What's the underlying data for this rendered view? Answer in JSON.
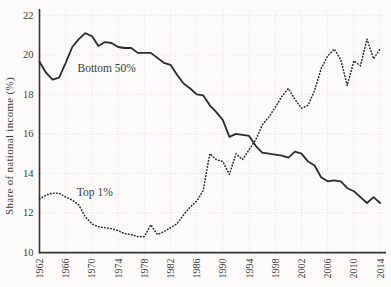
{
  "figure": {
    "width_px": 391,
    "height_px": 287
  },
  "chart_data": {
    "type": "line",
    "title": "",
    "xlabel": "",
    "ylabel": "Share of national income (%)",
    "xlim": [
      1962,
      2015.5
    ],
    "ylim": [
      9.7,
      22.3
    ],
    "grid": true,
    "legend_position": "inline-annotations",
    "xticks": [
      1962,
      1966,
      1970,
      1974,
      1978,
      1982,
      1986,
      1990,
      1994,
      1998,
      2002,
      2006,
      2010,
      2014
    ],
    "yticks": [
      10,
      12,
      14,
      16,
      18,
      20,
      22
    ],
    "x": [
      1962,
      1963,
      1964,
      1965,
      1966,
      1967,
      1968,
      1969,
      1970,
      1971,
      1972,
      1973,
      1974,
      1975,
      1976,
      1977,
      1978,
      1979,
      1980,
      1981,
      1982,
      1983,
      1984,
      1985,
      1986,
      1987,
      1988,
      1989,
      1990,
      1991,
      1992,
      1993,
      1994,
      1995,
      1996,
      1997,
      1998,
      1999,
      2000,
      2001,
      2002,
      2003,
      2004,
      2005,
      2006,
      2007,
      2008,
      2009,
      2010,
      2011,
      2012,
      2013,
      2014
    ],
    "series": [
      {
        "name": "Bottom 50%",
        "style": "solid",
        "values": [
          19.65,
          19.1,
          18.75,
          18.85,
          19.6,
          20.4,
          20.8,
          21.1,
          20.95,
          20.45,
          20.65,
          20.6,
          20.4,
          20.35,
          20.35,
          20.1,
          20.1,
          20.1,
          19.85,
          19.6,
          19.5,
          19.0,
          18.55,
          18.3,
          18.0,
          17.95,
          17.45,
          17.1,
          16.7,
          15.85,
          16.0,
          15.95,
          15.9,
          15.4,
          15.05,
          15.0,
          14.95,
          14.9,
          14.8,
          15.1,
          15.0,
          14.6,
          14.4,
          13.8,
          13.6,
          13.65,
          13.6,
          13.25,
          13.1,
          12.8,
          12.5,
          12.8,
          12.5
        ]
      },
      {
        "name": "Top 1%",
        "style": "dotted",
        "values": [
          12.7,
          12.9,
          13.0,
          13.0,
          12.8,
          12.65,
          12.4,
          11.8,
          11.45,
          11.3,
          11.25,
          11.2,
          11.1,
          10.95,
          10.9,
          10.8,
          10.8,
          11.4,
          10.9,
          11.05,
          11.25,
          11.45,
          11.9,
          12.3,
          12.6,
          13.15,
          15.0,
          14.7,
          14.6,
          13.95,
          15.0,
          14.7,
          15.2,
          15.7,
          16.45,
          16.85,
          17.35,
          17.9,
          18.3,
          17.75,
          17.3,
          17.45,
          18.2,
          19.3,
          19.95,
          20.3,
          19.75,
          18.45,
          19.7,
          19.45,
          20.8,
          19.8,
          20.3
        ]
      }
    ],
    "annotations": [
      {
        "text": "Bottom 50%",
        "year": 1967.8,
        "value": 19.35
      },
      {
        "text": "Top 1%",
        "year": 1967.7,
        "value": 13.05
      }
    ],
    "colors": {
      "line": "#2b2b2b",
      "grid": "#e4dbdb",
      "axis": "#333333",
      "text": "#3b3b3b",
      "background": "#fcfbf9"
    }
  }
}
